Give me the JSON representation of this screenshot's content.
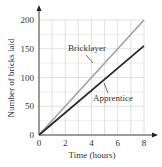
{
  "chart_data": {
    "type": "line",
    "title": "",
    "xlabel": "Time (hours)",
    "ylabel": "Number of bricks laid",
    "xlim": [
      0,
      8
    ],
    "ylim": [
      0,
      200
    ],
    "x_ticks": [
      "0",
      "2",
      "4",
      "6",
      "8"
    ],
    "y_ticks": [
      "0",
      "50",
      "100",
      "150",
      "200"
    ],
    "grid": true,
    "grid_x_step": 1,
    "grid_y_step": 25,
    "legend": "inline labels with leader lines",
    "series": [
      {
        "name": "Bricklayer",
        "x": [
          0,
          8
        ],
        "values": [
          0,
          200
        ],
        "color": "#a6a6a6"
      },
      {
        "name": "Apprentice",
        "x": [
          0,
          8
        ],
        "values": [
          0,
          155
        ],
        "color": "#2b2b2b"
      }
    ]
  },
  "colors": {
    "axis": "#222222",
    "grid": "#cfcfcf",
    "text": "#333333"
  }
}
